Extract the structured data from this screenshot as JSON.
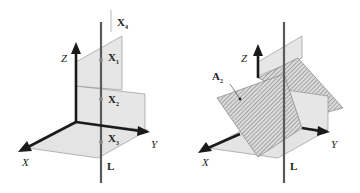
{
  "figure": {
    "left_panel": {
      "axes": {
        "x": "X",
        "y": "Y",
        "z": "Z"
      },
      "line_label": "L",
      "points": [
        {
          "base": "X",
          "sub": "4"
        },
        {
          "base": "X",
          "sub": "1"
        },
        {
          "base": "X",
          "sub": "2"
        },
        {
          "base": "X",
          "sub": "3"
        }
      ]
    },
    "right_panel": {
      "axes": {
        "x": "X",
        "y": "Y",
        "z": "Z"
      },
      "line_label": "L",
      "plane_label": {
        "base": "A",
        "sub": "2"
      }
    },
    "colors": {
      "axis": "#1a1a1a",
      "line_L": "#5a5a5a",
      "plane_fill": "#e4e4e4",
      "plane_edge": "#8a8a8a",
      "hatch": "#6a6a6a"
    }
  }
}
